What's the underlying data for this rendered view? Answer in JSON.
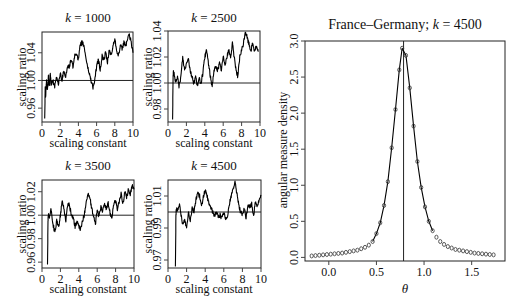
{
  "chart_data": [
    {
      "type": "line",
      "title": "k = 1000",
      "title_k": "k",
      "title_rest": " = 1000",
      "xlabel": "scaling constant",
      "ylabel": "scaling ratio",
      "xlim": [
        0,
        10
      ],
      "ylim": [
        0.94,
        1.07
      ],
      "xticks": [
        0,
        2,
        4,
        6,
        8,
        10
      ],
      "yticks": [
        0.96,
        1.0,
        1.04
      ],
      "ytick_labels": [
        "0.96",
        "1.00",
        "1.04"
      ],
      "reference_line": 1.0,
      "x": [
        0.3,
        0.35,
        0.4,
        0.5,
        0.6,
        0.7,
        0.8,
        0.9,
        1.0,
        1.2,
        1.4,
        1.6,
        1.8,
        2.0,
        2.2,
        2.4,
        2.6,
        2.8,
        3.0,
        3.2,
        3.4,
        3.6,
        3.8,
        4.0,
        4.2,
        4.4,
        4.6,
        4.8,
        5.0,
        5.2,
        5.4,
        5.6,
        5.8,
        6.0,
        6.2,
        6.4,
        6.6,
        6.8,
        7.0,
        7.2,
        7.4,
        7.6,
        7.8,
        8.0,
        8.2,
        8.4,
        8.6,
        8.8,
        9.0,
        9.2,
        9.4,
        9.6,
        9.8,
        10.0
      ],
      "values": [
        0.945,
        0.99,
        0.975,
        1.0,
        0.985,
        1.005,
        0.99,
        1.01,
        0.995,
        1.0,
        0.99,
        1.005,
        0.995,
        1.01,
        1.0,
        1.015,
        1.005,
        1.02,
        1.02,
        1.03,
        1.02,
        1.035,
        1.04,
        1.03,
        1.05,
        1.055,
        1.05,
        1.035,
        1.02,
        1.01,
        1.0,
        0.99,
        1.0,
        1.02,
        1.03,
        1.015,
        1.035,
        1.03,
        1.04,
        1.025,
        1.045,
        1.035,
        1.05,
        1.06,
        1.045,
        1.035,
        1.05,
        1.045,
        1.055,
        1.05,
        1.06,
        1.065,
        1.055,
        1.04
      ]
    },
    {
      "type": "line",
      "title": "k = 2500",
      "title_k": "k",
      "title_rest": " = 2500",
      "xlabel": "scaling constant",
      "ylabel": "scaling ratio",
      "xlim": [
        0,
        10
      ],
      "ylim": [
        0.97,
        1.04
      ],
      "xticks": [
        0,
        2,
        4,
        6,
        8,
        10
      ],
      "yticks": [
        0.98,
        1.0,
        1.02,
        1.04
      ],
      "ytick_labels": [
        "0.98",
        "1.00",
        "1.02",
        "1.04"
      ],
      "reference_line": 1.0,
      "x": [
        0.5,
        0.55,
        0.6,
        0.8,
        1.0,
        1.2,
        1.4,
        1.6,
        1.8,
        2.0,
        2.2,
        2.4,
        2.6,
        2.8,
        3.0,
        3.2,
        3.4,
        3.6,
        3.8,
        4.0,
        4.2,
        4.4,
        4.6,
        4.8,
        5.0,
        5.2,
        5.4,
        5.6,
        5.8,
        6.0,
        6.2,
        6.4,
        6.6,
        6.8,
        7.0,
        7.2,
        7.4,
        7.6,
        7.8,
        8.0,
        8.2,
        8.4,
        8.6,
        8.8,
        9.0,
        9.2,
        9.4,
        9.6,
        9.8
      ],
      "values": [
        0.972,
        1.005,
        1.01,
        1.0,
        1.005,
        0.997,
        1.005,
        1.02,
        1.01,
        1.015,
        1.02,
        1.01,
        1.005,
        1.0,
        1.005,
        0.998,
        1.003,
        1.0,
        1.008,
        1.02,
        1.025,
        1.015,
        1.005,
        0.998,
        1.01,
        1.012,
        1.01,
        1.015,
        1.01,
        1.02,
        1.015,
        1.02,
        1.025,
        1.02,
        1.03,
        1.02,
        1.01,
        1.005,
        1.02,
        1.025,
        1.03,
        1.04,
        1.035,
        1.03,
        1.025,
        1.03,
        1.025,
        1.028,
        1.024
      ]
    },
    {
      "type": "line",
      "title": "k = 3500",
      "title_k": "k",
      "title_rest": " = 3500",
      "xlabel": "scaling constant",
      "ylabel": "scaling ratio",
      "xlim": [
        0,
        10
      ],
      "ylim": [
        0.955,
        1.03
      ],
      "xticks": [
        0,
        2,
        4,
        6,
        8,
        10
      ],
      "yticks": [
        0.96,
        0.98,
        1.0,
        1.02
      ],
      "ytick_labels": [
        "0.96",
        "0.98",
        "1.00",
        "1.02"
      ],
      "reference_line": 1.0,
      "x": [
        0.6,
        0.65,
        0.7,
        0.8,
        1.0,
        1.2,
        1.4,
        1.6,
        1.8,
        2.0,
        2.2,
        2.4,
        2.6,
        2.8,
        3.0,
        3.2,
        3.4,
        3.6,
        3.8,
        4.0,
        4.2,
        4.4,
        4.6,
        4.8,
        5.0,
        5.2,
        5.4,
        5.6,
        5.8,
        6.0,
        6.2,
        6.4,
        6.6,
        6.8,
        7.0,
        7.2,
        7.4,
        7.6,
        7.8,
        8.0,
        8.2,
        8.4,
        8.6,
        8.8,
        9.0,
        9.2,
        9.4,
        9.6,
        9.8,
        10.0
      ],
      "values": [
        0.958,
        0.995,
        1.0,
        0.998,
        1.005,
        0.992,
        0.985,
        0.995,
        0.99,
        1.0,
        1.012,
        1.005,
        0.995,
        1.01,
        1.008,
        1.0,
        0.998,
        0.99,
        0.995,
        0.99,
        0.988,
        0.995,
        1.0,
        1.012,
        1.018,
        1.015,
        1.005,
        1.0,
        0.992,
        1.005,
        0.998,
        1.008,
        1.003,
        1.01,
        1.005,
        1.01,
        1.002,
        0.998,
        1.01,
        1.012,
        1.005,
        1.012,
        1.018,
        1.01,
        1.02,
        1.015,
        1.022,
        1.018,
        1.025,
        1.022
      ]
    },
    {
      "type": "line",
      "title": "k = 4500",
      "title_k": "k",
      "title_rest": " = 4500",
      "xlabel": "scaling constant",
      "ylabel": "scaling ratio",
      "xlim": [
        0,
        10
      ],
      "ylim": [
        0.965,
        1.02
      ],
      "xticks": [
        0,
        2,
        4,
        6,
        8,
        10
      ],
      "yticks": [
        0.97,
        0.99,
        1.01
      ],
      "ytick_labels": [
        "0.97",
        "0.99",
        "1.01"
      ],
      "reference_line": 1.0,
      "x": [
        0.8,
        0.85,
        0.9,
        1.0,
        1.2,
        1.4,
        1.6,
        1.8,
        2.0,
        2.2,
        2.4,
        2.6,
        2.8,
        3.0,
        3.2,
        3.4,
        3.6,
        3.8,
        4.0,
        4.2,
        4.4,
        4.6,
        4.8,
        5.0,
        5.2,
        5.4,
        5.6,
        5.8,
        6.0,
        6.2,
        6.4,
        6.6,
        6.8,
        7.0,
        7.2,
        7.4,
        7.6,
        7.8,
        8.0,
        8.2,
        8.4,
        8.6,
        8.8,
        9.0,
        9.2,
        9.4,
        9.6,
        9.8,
        10.0
      ],
      "values": [
        0.966,
        0.998,
        1.002,
        1.0,
        1.005,
        0.998,
        0.992,
        0.995,
        0.99,
        1.0,
        0.995,
        1.003,
        1.0,
        1.008,
        1.012,
        1.01,
        1.003,
        1.01,
        1.013,
        1.01,
        1.005,
        1.003,
        1.0,
        0.998,
        1.0,
        0.997,
        0.998,
        0.996,
        1.0,
        0.995,
        0.998,
        1.005,
        1.01,
        1.015,
        1.018,
        1.012,
        1.005,
        1.0,
        0.998,
        1.002,
        0.996,
        1.005,
        1.003,
        1.005,
        0.998,
        1.006,
        1.004,
        1.007,
        1.01
      ]
    },
    {
      "type": "line",
      "title": "France–Germany; k = 4500",
      "title_pre": "France–Germany; ",
      "title_k": "k",
      "title_rest": " = 4500",
      "xlabel": "θ",
      "ylabel": "angular measure density",
      "xlim": [
        -0.25,
        1.85
      ],
      "ylim": [
        -0.05,
        3.0
      ],
      "xticks": [
        0.0,
        0.5,
        1.0,
        1.5
      ],
      "xtick_labels": [
        "0.0",
        "0.5",
        "1.0",
        "1.5"
      ],
      "yticks": [
        0.0,
        0.5,
        1.0,
        1.5,
        2.0,
        2.5,
        3.0
      ],
      "ytick_labels": [
        "0.0",
        "0.5",
        "1.0",
        "1.5",
        "2.0",
        "2.5",
        "3.0"
      ],
      "reference_vline": 0.785,
      "marker": "o",
      "x": [
        -0.18,
        -0.14,
        -0.1,
        -0.06,
        -0.02,
        0.02,
        0.06,
        0.1,
        0.14,
        0.18,
        0.22,
        0.26,
        0.3,
        0.34,
        0.38,
        0.42,
        0.46,
        0.5,
        0.54,
        0.58,
        0.62,
        0.66,
        0.7,
        0.74,
        0.77,
        0.81,
        0.85,
        0.89,
        0.93,
        0.97,
        1.01,
        1.05,
        1.09,
        1.13,
        1.17,
        1.21,
        1.25,
        1.29,
        1.33,
        1.37,
        1.41,
        1.45,
        1.49,
        1.53,
        1.57,
        1.61,
        1.65,
        1.69,
        1.73
      ],
      "values": [
        0.02,
        0.025,
        0.03,
        0.035,
        0.04,
        0.045,
        0.05,
        0.055,
        0.06,
        0.07,
        0.08,
        0.09,
        0.1,
        0.12,
        0.14,
        0.17,
        0.22,
        0.33,
        0.48,
        0.72,
        1.05,
        1.52,
        2.05,
        2.6,
        2.9,
        2.8,
        2.35,
        1.82,
        1.33,
        0.97,
        0.7,
        0.5,
        0.37,
        0.28,
        0.22,
        0.18,
        0.15,
        0.13,
        0.11,
        0.1,
        0.09,
        0.08,
        0.07,
        0.06,
        0.055,
        0.05,
        0.045,
        0.04,
        0.035
      ]
    }
  ],
  "panels": {
    "p1": {
      "title_k": "k",
      "title_rest": " = 1000",
      "xlabel": "scaling constant",
      "ylabel": "scaling ratio"
    },
    "p2": {
      "title_k": "k",
      "title_rest": " = 2500",
      "xlabel": "scaling constant",
      "ylabel": "scaling ratio"
    },
    "p3": {
      "title_k": "k",
      "title_rest": " = 3500",
      "xlabel": "scaling constant",
      "ylabel": "scaling ratio"
    },
    "p4": {
      "title_k": "k",
      "title_rest": " = 4500",
      "xlabel": "scaling constant",
      "ylabel": "scaling ratio"
    },
    "p5": {
      "title_pre": "France–Germany; ",
      "title_k": "k",
      "title_rest": " = 4500",
      "xlabel": "θ",
      "ylabel": "angular measure density"
    }
  }
}
